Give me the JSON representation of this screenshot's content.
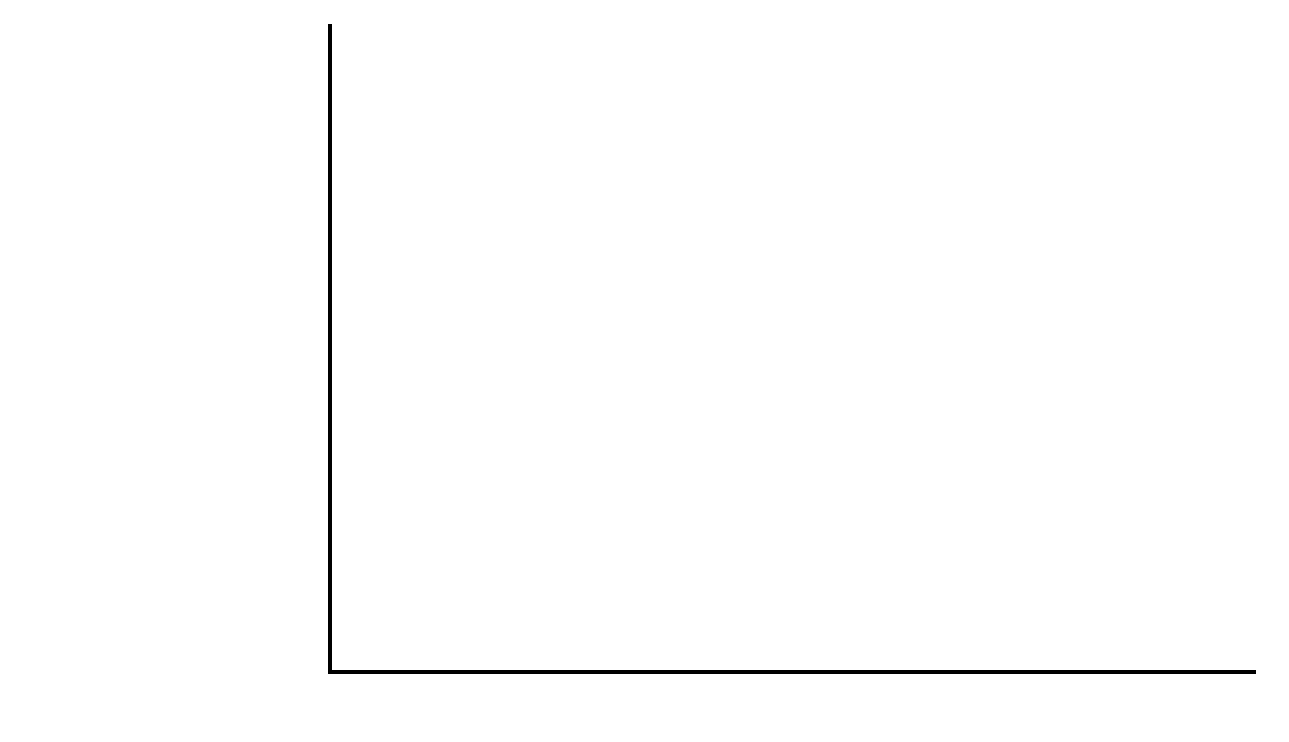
{
  "figure": {
    "axis_title_prefix": "Average net primary productivity (kcal/m",
    "axis_title_sup": "2",
    "axis_title_suffix": "/yr)"
  },
  "chart_data": {
    "type": "bar",
    "orientation": "horizontal",
    "title": "",
    "xlabel": "Average net primary productivity (kcal/m2/yr)",
    "ylabel": "",
    "xlim": [
      0,
      9600
    ],
    "grid": false,
    "legend": "none",
    "tick_labels": [
      "800",
      "1,600",
      "2,400",
      "3,200",
      "4,000",
      "4,800",
      "5,600",
      "6,400",
      "7,200",
      "8,000",
      "8,800",
      "9,600"
    ],
    "ticks": [
      800,
      1600,
      2400,
      3200,
      4000,
      4800,
      5600,
      6400,
      7200,
      8000,
      8800,
      9600
    ],
    "colors": {
      "terrestrial": "#7a7a7a",
      "aquatic": "#4a4a4a",
      "axis": "#000000"
    },
    "groups": [
      {
        "name": "Terrestrial Ecosystems",
        "series": "terrestrial",
        "categories": [
          "Swamps and marshes",
          "Tropical rain forest",
          "Temperate forest",
          "Northern coniferous forest (taiga)",
          "Savanna",
          "Agricultural land",
          "Woodland and shrubland",
          "Temperate grassland",
          "Tundra (arctic and alpine)",
          "Desert scrub",
          "Extreme desert"
        ],
        "values": [
          8900,
          8900,
          5800,
          3500,
          3000,
          2800,
          2600,
          2100,
          500,
          200,
          50
        ]
      },
      {
        "name": "Aquatic Ecosystems",
        "series": "aquatic",
        "categories": [
          "Estuaries",
          "Lakes and streams",
          "Continental shelf",
          "Open ocean"
        ],
        "values": [
          8950,
          2150,
          1450,
          1150
        ]
      }
    ]
  }
}
